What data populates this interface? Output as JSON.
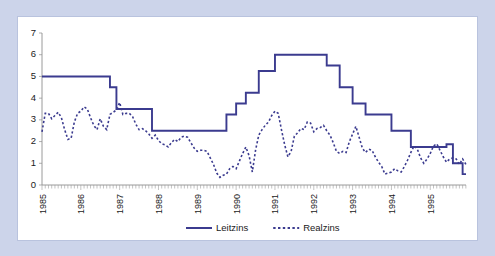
{
  "chart_data": {
    "type": "line",
    "title": "",
    "subtitle": "",
    "xlabel": "",
    "ylabel": "",
    "ylim": [
      0,
      7
    ],
    "ytick_labels": [
      "0",
      "1",
      "2",
      "3",
      "4",
      "5",
      "6",
      "7"
    ],
    "ytick_values": [
      0,
      1,
      2,
      3,
      4,
      5,
      6,
      7
    ],
    "xlim": [
      1985.0,
      1995.92
    ],
    "xtick_labels": [
      "1985",
      "1986",
      "1987",
      "1988",
      "1989",
      "1990",
      "1991",
      "1992",
      "1993",
      "1994",
      "1995"
    ],
    "xtick_values": [
      1985,
      1986,
      1987,
      1988,
      1989,
      1990,
      1991,
      1992,
      1993,
      1994,
      1995
    ],
    "minor_ticks": "monthly",
    "grid": false,
    "legend_position": "bottom-center",
    "series": [
      {
        "name": "Leitzins",
        "style": "solid",
        "color": "#3b3b8f",
        "step": true,
        "x": [
          1985.0,
          1985.083,
          1985.167,
          1985.25,
          1985.333,
          1985.417,
          1985.5,
          1985.583,
          1985.667,
          1985.75,
          1985.833,
          1985.917,
          1986.0,
          1986.083,
          1986.167,
          1986.25,
          1986.333,
          1986.417,
          1986.5,
          1986.583,
          1986.667,
          1986.75,
          1986.833,
          1986.917,
          1987.0,
          1987.083,
          1987.167,
          1987.25,
          1987.333,
          1987.417,
          1987.5,
          1987.583,
          1987.667,
          1987.75,
          1987.833,
          1987.917,
          1988.0,
          1988.083,
          1988.167,
          1988.25,
          1988.333,
          1988.417,
          1988.5,
          1988.583,
          1988.667,
          1988.75,
          1988.833,
          1988.917,
          1989.0,
          1989.083,
          1989.167,
          1989.25,
          1989.333,
          1989.417,
          1989.5,
          1989.583,
          1989.667,
          1989.75,
          1989.833,
          1989.917,
          1990.0,
          1990.083,
          1990.167,
          1990.25,
          1990.333,
          1990.417,
          1990.5,
          1990.583,
          1990.667,
          1990.75,
          1990.833,
          1990.917,
          1991.0,
          1991.083,
          1991.167,
          1991.25,
          1991.333,
          1991.417,
          1991.5,
          1991.583,
          1991.667,
          1991.75,
          1991.833,
          1991.917,
          1992.0,
          1992.083,
          1992.167,
          1992.25,
          1992.333,
          1992.417,
          1992.5,
          1992.583,
          1992.667,
          1992.75,
          1992.833,
          1992.917,
          1993.0,
          1993.083,
          1993.167,
          1993.25,
          1993.333,
          1993.417,
          1993.5,
          1993.583,
          1993.667,
          1993.75,
          1993.833,
          1993.917,
          1994.0,
          1994.083,
          1994.167,
          1994.25,
          1994.333,
          1994.417,
          1994.5,
          1994.583,
          1994.667,
          1994.75,
          1994.833,
          1994.917,
          1995.0,
          1995.083,
          1995.167,
          1995.25,
          1995.333,
          1995.417,
          1995.5,
          1995.583,
          1995.667,
          1995.75,
          1995.833,
          1995.917
        ],
        "values": [
          5.0,
          5.0,
          5.0,
          5.0,
          5.0,
          5.0,
          5.0,
          5.0,
          5.0,
          5.0,
          5.0,
          5.0,
          5.0,
          5.0,
          5.0,
          5.0,
          5.0,
          5.0,
          5.0,
          5.0,
          5.0,
          4.5,
          4.5,
          3.5,
          3.5,
          3.5,
          3.5,
          3.5,
          3.5,
          3.5,
          3.5,
          3.5,
          3.5,
          3.5,
          2.5,
          2.5,
          2.5,
          2.5,
          2.5,
          2.5,
          2.5,
          2.5,
          2.5,
          2.5,
          2.5,
          2.5,
          2.5,
          2.5,
          2.5,
          2.5,
          2.5,
          2.5,
          2.5,
          2.5,
          2.5,
          2.5,
          2.5,
          3.25,
          3.25,
          3.25,
          3.75,
          3.75,
          3.75,
          4.25,
          4.25,
          4.25,
          4.25,
          5.25,
          5.25,
          5.25,
          5.25,
          5.25,
          6.0,
          6.0,
          6.0,
          6.0,
          6.0,
          6.0,
          6.0,
          6.0,
          6.0,
          6.0,
          6.0,
          6.0,
          6.0,
          6.0,
          6.0,
          6.0,
          5.5,
          5.5,
          5.5,
          5.5,
          4.5,
          4.5,
          4.5,
          4.5,
          3.75,
          3.75,
          3.75,
          3.75,
          3.25,
          3.25,
          3.25,
          3.25,
          3.25,
          3.25,
          3.25,
          3.25,
          2.5,
          2.5,
          2.5,
          2.5,
          2.5,
          2.5,
          1.75,
          1.75,
          1.75,
          1.75,
          1.75,
          1.75,
          1.75,
          1.75,
          1.75,
          1.75,
          1.75,
          1.875,
          1.875,
          1.0,
          1.0,
          1.0,
          0.5,
          0.5
        ]
      },
      {
        "name": "Realzins",
        "style": "dashed",
        "color": "#3b3b8f",
        "step": false,
        "x": [
          1985.0,
          1985.083,
          1985.167,
          1985.25,
          1985.333,
          1985.417,
          1985.5,
          1985.583,
          1985.667,
          1985.75,
          1985.833,
          1985.917,
          1986.0,
          1986.083,
          1986.167,
          1986.25,
          1986.333,
          1986.417,
          1986.5,
          1986.583,
          1986.667,
          1986.75,
          1986.833,
          1986.917,
          1987.0,
          1987.083,
          1987.167,
          1987.25,
          1987.333,
          1987.417,
          1987.5,
          1987.583,
          1987.667,
          1987.75,
          1987.833,
          1987.917,
          1988.0,
          1988.083,
          1988.167,
          1988.25,
          1988.333,
          1988.417,
          1988.5,
          1988.583,
          1988.667,
          1988.75,
          1988.833,
          1988.917,
          1989.0,
          1989.083,
          1989.167,
          1989.25,
          1989.333,
          1989.417,
          1989.5,
          1989.583,
          1989.667,
          1989.75,
          1989.833,
          1989.917,
          1990.0,
          1990.083,
          1990.167,
          1990.25,
          1990.333,
          1990.417,
          1990.5,
          1990.583,
          1990.667,
          1990.75,
          1990.833,
          1990.917,
          1991.0,
          1991.083,
          1991.167,
          1991.25,
          1991.333,
          1991.417,
          1991.5,
          1991.583,
          1991.667,
          1991.75,
          1991.833,
          1991.917,
          1992.0,
          1992.083,
          1992.167,
          1992.25,
          1992.333,
          1992.417,
          1992.5,
          1992.583,
          1992.667,
          1992.75,
          1992.833,
          1992.917,
          1993.0,
          1993.083,
          1993.167,
          1993.25,
          1993.333,
          1993.417,
          1993.5,
          1993.583,
          1993.667,
          1993.75,
          1993.833,
          1993.917,
          1994.0,
          1994.083,
          1994.167,
          1994.25,
          1994.333,
          1994.417,
          1994.5,
          1994.583,
          1994.667,
          1994.75,
          1994.833,
          1994.917,
          1995.0,
          1995.083,
          1995.167,
          1995.25,
          1995.333,
          1995.417,
          1995.5,
          1995.583,
          1995.667,
          1995.75,
          1995.833,
          1995.917
        ],
        "values": [
          2.45,
          3.3,
          3.3,
          3.05,
          3.2,
          3.35,
          3.1,
          2.55,
          2.1,
          2.15,
          2.9,
          3.3,
          3.4,
          3.6,
          3.5,
          3.1,
          2.75,
          2.55,
          3.05,
          2.7,
          2.55,
          3.25,
          3.35,
          3.45,
          3.8,
          3.25,
          3.3,
          3.3,
          3.15,
          2.8,
          2.55,
          2.6,
          2.5,
          2.35,
          2.15,
          2.3,
          2.05,
          1.9,
          1.85,
          1.75,
          1.95,
          2.1,
          2.0,
          2.2,
          2.25,
          2.2,
          1.95,
          1.7,
          1.55,
          1.6,
          1.6,
          1.55,
          1.25,
          0.95,
          0.55,
          0.35,
          0.45,
          0.5,
          0.75,
          0.85,
          0.75,
          1.1,
          1.45,
          1.75,
          1.35,
          0.6,
          1.6,
          2.3,
          2.55,
          2.75,
          2.9,
          3.2,
          3.4,
          3.3,
          2.55,
          1.85,
          1.3,
          1.55,
          2.25,
          2.4,
          2.6,
          2.55,
          2.9,
          2.85,
          2.45,
          2.6,
          2.65,
          2.75,
          2.5,
          2.3,
          1.95,
          1.55,
          1.45,
          1.55,
          1.5,
          2.0,
          2.35,
          2.7,
          2.2,
          1.7,
          1.5,
          1.65,
          1.6,
          1.3,
          1.05,
          0.85,
          0.5,
          0.55,
          0.6,
          0.75,
          0.65,
          0.6,
          0.85,
          1.15,
          1.5,
          1.8,
          1.65,
          1.25,
          1.0,
          1.2,
          1.45,
          1.8,
          1.9,
          1.6,
          1.3,
          1.05,
          1.2,
          1.25,
          1.2,
          0.95,
          1.2,
          0.95
        ]
      }
    ]
  },
  "legend": {
    "items": [
      {
        "label": "Leitzins",
        "style": "solid"
      },
      {
        "label": "Realzins",
        "style": "dashed"
      }
    ]
  }
}
